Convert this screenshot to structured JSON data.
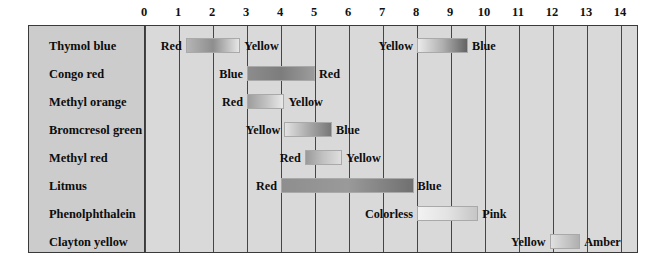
{
  "chart_data": {
    "type": "bar",
    "title": "",
    "subtitle": "",
    "xlabel": "",
    "ylabel": "",
    "xlim": [
      0,
      14
    ],
    "ylim": null,
    "grid": true,
    "legend_position": "none",
    "orientation": "horizontal",
    "axis": {
      "position": "top",
      "ticks": [
        0,
        1,
        2,
        3,
        4,
        5,
        6,
        7,
        8,
        9,
        10,
        11,
        12,
        13,
        14
      ],
      "tick_labels": [
        "0",
        "1",
        "2",
        "3",
        "4",
        "5",
        "6",
        "7",
        "8",
        "9",
        "10",
        "11",
        "12",
        "13",
        "14"
      ]
    },
    "categories": [
      "Thymol blue",
      "Congo red",
      "Methyl orange",
      "Bromcresol green",
      "Methyl red",
      "Litmus",
      "Phenolphthalein",
      "Clayton yellow"
    ],
    "series": [
      {
        "name": "Thymol blue",
        "bands": [
          {
            "start": 1.2,
            "end": 2.8,
            "acid_label": "Red",
            "base_label": "Yellow",
            "start_color": "#b5b5b5",
            "mid_color": "#8e8e8e",
            "end_color": "#e6e6e6"
          },
          {
            "start": 8.0,
            "end": 9.5,
            "acid_label": "Yellow",
            "base_label": "Blue",
            "start_color": "#eaeaea",
            "mid_color": "#b0b0b0",
            "end_color": "#636363"
          }
        ]
      },
      {
        "name": "Congo red",
        "bands": [
          {
            "start": 3.0,
            "end": 5.0,
            "acid_label": "Blue",
            "base_label": "Red",
            "start_color": "#8c8c8c",
            "mid_color": "#7d7d7d",
            "end_color": "#9c9c9c"
          }
        ]
      },
      {
        "name": "Methyl orange",
        "bands": [
          {
            "start": 3.0,
            "end": 4.1,
            "acid_label": "Red",
            "base_label": "Yellow",
            "start_color": "#9d9d9d",
            "mid_color": "#c0c0c0",
            "end_color": "#e8e8e8"
          }
        ]
      },
      {
        "name": "Bromcresol green",
        "bands": [
          {
            "start": 4.1,
            "end": 5.5,
            "acid_label": "Yellow",
            "base_label": "Blue",
            "start_color": "#e2e2e2",
            "mid_color": "#ababab",
            "end_color": "#777777"
          }
        ]
      },
      {
        "name": "Methyl red",
        "bands": [
          {
            "start": 4.7,
            "end": 5.8,
            "acid_label": "Red",
            "base_label": "Yellow",
            "start_color": "#9a9a9a",
            "mid_color": "#c2c2c2",
            "end_color": "#dedede"
          }
        ]
      },
      {
        "name": "Litmus",
        "bands": [
          {
            "start": 4.0,
            "end": 7.9,
            "acid_label": "Red",
            "base_label": "Blue",
            "start_color": "#8e8e8e",
            "mid_color": "#9a9a9a",
            "end_color": "#707070"
          }
        ]
      },
      {
        "name": "Phenolphthalein",
        "bands": [
          {
            "start": 8.0,
            "end": 9.8,
            "acid_label": "Colorless",
            "base_label": "Pink",
            "start_color": "#f2f2f2",
            "mid_color": "#e3e3e3",
            "end_color": "#c6c6c6"
          }
        ]
      },
      {
        "name": "Clayton yellow",
        "bands": [
          {
            "start": 11.9,
            "end": 12.8,
            "acid_label": "Yellow",
            "base_label": "Amber",
            "start_color": "#e0e0e0",
            "mid_color": "#c8c8c8",
            "end_color": "#b0b0b0"
          }
        ]
      }
    ],
    "colors": {
      "panel_background": "#d9d9d9",
      "label_column_background": "#cccccc",
      "frame_border": "#3a3a3a",
      "gridline": "#44444a",
      "text": "#0d0d0d",
      "page_background": "#ffffff"
    }
  }
}
